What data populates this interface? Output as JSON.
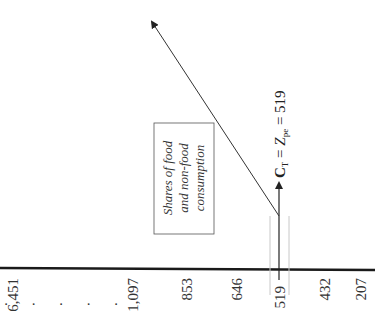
{
  "diagram": {
    "orientation": "rotated-90-ccw",
    "axis_ticks": [
      {
        "label": "6,451"
      },
      {
        "label": ". . . . ."
      },
      {
        "label": "1,097"
      },
      {
        "label": "853"
      },
      {
        "label": "646"
      },
      {
        "label": "519"
      },
      {
        "label": "432"
      },
      {
        "label": "207"
      }
    ],
    "box_lines": [
      "Shares of food",
      "and non-food",
      "consumption"
    ],
    "equation": {
      "lhs": "C",
      "lhs_sub": "T",
      "eq1": " = ",
      "mid": "Z",
      "mid_sub": "pe",
      "eq2": " = 519"
    },
    "highlight_value": "519"
  }
}
